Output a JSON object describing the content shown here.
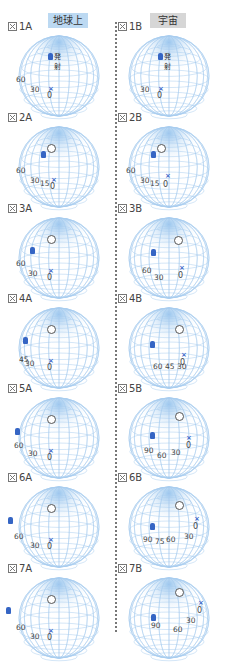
{
  "headers": {
    "earth": "地球上",
    "space": "宇宙"
  },
  "figure_prefix_icon": "figure-box-icon",
  "launch_label": "発射",
  "colors": {
    "earth_header": "#bcd9f2",
    "space_header": "#d6d6d6",
    "grid": "#a9cdee",
    "marker": "#3565c4"
  },
  "panels": [
    {
      "id": "1A",
      "label": "1A",
      "col": "A",
      "row": 0,
      "labels": [
        "60",
        "30"
      ],
      "zero": "0",
      "launch": true
    },
    {
      "id": "1B",
      "label": "1B",
      "col": "B",
      "row": 0,
      "labels": [
        "30"
      ],
      "zero": "0",
      "launch": true
    },
    {
      "id": "2A",
      "label": "2A",
      "col": "A",
      "row": 1,
      "labels": [
        "60",
        "30",
        "15"
      ],
      "zero": "0"
    },
    {
      "id": "2B",
      "label": "2B",
      "col": "B",
      "row": 1,
      "labels": [
        "60",
        "30",
        "15"
      ],
      "zero": "0"
    },
    {
      "id": "3A",
      "label": "3A",
      "col": "A",
      "row": 2,
      "labels": [
        "60",
        "30"
      ],
      "zero": "0"
    },
    {
      "id": "3B",
      "label": "3B",
      "col": "B",
      "row": 2,
      "labels": [
        "60",
        "30"
      ],
      "zero": "0"
    },
    {
      "id": "4A",
      "label": "4A",
      "col": "A",
      "row": 3,
      "labels": [
        "45",
        "30"
      ],
      "zero": "0"
    },
    {
      "id": "4B",
      "label": "4B",
      "col": "B",
      "row": 3,
      "labels": [
        "60",
        "45",
        "30"
      ],
      "zero": "0"
    },
    {
      "id": "5A",
      "label": "5A",
      "col": "A",
      "row": 4,
      "labels": [
        "60",
        "30"
      ],
      "zero": "0"
    },
    {
      "id": "5B",
      "label": "5B",
      "col": "B",
      "row": 4,
      "labels": [
        "90",
        "60",
        "30"
      ],
      "zero": "0"
    },
    {
      "id": "6A",
      "label": "6A",
      "col": "A",
      "row": 5,
      "labels": [
        "60",
        "30"
      ],
      "zero": "0"
    },
    {
      "id": "6B",
      "label": "6B",
      "col": "B",
      "row": 5,
      "labels": [
        "90",
        "75",
        "60",
        "30"
      ],
      "zero": "0"
    },
    {
      "id": "7A",
      "label": "7A",
      "col": "A",
      "row": 6,
      "labels": [
        "60",
        "30"
      ],
      "zero": "0"
    },
    {
      "id": "7B",
      "label": "7B",
      "col": "B",
      "row": 6,
      "labels": [
        "90",
        "60",
        "30"
      ],
      "zero": "0"
    }
  ]
}
